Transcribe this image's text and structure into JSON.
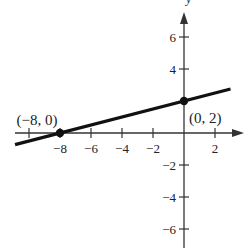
{
  "chart_data": {
    "type": "line",
    "title": "",
    "xlabel": "x",
    "ylabel": "y",
    "xlim": [
      -10.9,
      3.8
    ],
    "ylim": [
      -7.2,
      7.6
    ],
    "grid": false,
    "x_ticks": [
      -10,
      -8,
      -6,
      -4,
      -2,
      2
    ],
    "x_tick_labels": [
      "",
      "−8",
      "−6",
      "−4",
      "−2",
      "2"
    ],
    "y_ticks": [
      -6,
      -4,
      -2,
      4,
      6
    ],
    "y_tick_labels": [
      "−6",
      "−4",
      "−2",
      "4",
      "6"
    ],
    "series": [
      {
        "name": "line",
        "equation": "y = 0.25x + 2",
        "x": [
          -10.9,
          3.0
        ],
        "y": [
          -0.725,
          2.75
        ]
      }
    ],
    "points": [
      {
        "x": -8,
        "y": 0,
        "label": "(−8, 0)"
      },
      {
        "x": 0,
        "y": 2,
        "label": "(0, 2)"
      }
    ]
  },
  "colors": {
    "axis": "#333333",
    "line": "#111111",
    "text": "#222222"
  }
}
